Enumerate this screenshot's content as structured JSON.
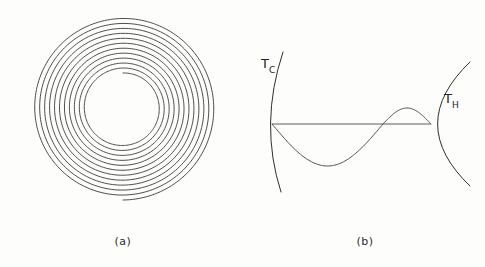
{
  "figure": {
    "background_color": "#fdfdfc",
    "ink_color": "#2e2e2e",
    "width": 485,
    "height": 267
  },
  "panels": [
    {
      "id": "a",
      "caption": "(a)",
      "caption_x": 123,
      "caption_y": 245,
      "type": "spiral",
      "description": "Archimedean spiral coil seen end-on",
      "spiral": {
        "center_x": 123,
        "center_y": 108,
        "inner_radius": 35,
        "outer_radius": 92,
        "turns": 11.5,
        "seam_angle_deg": -90,
        "points_per_turn": 180
      }
    },
    {
      "id": "b",
      "caption": "(b)",
      "caption_x": 365,
      "caption_y": 245,
      "type": "temperature-profile",
      "description": "Cold and hot boundary arcs with sinusoidal temperature perturbation",
      "labels": [
        {
          "name": "cold-temperature-label",
          "base": "T",
          "subscript": "C",
          "x": 261,
          "y": 68
        },
        {
          "name": "hot-temperature-label",
          "base": "T",
          "subscript": "H",
          "x": 444,
          "y": 103
        }
      ],
      "axis": {
        "x1": 272,
        "y1": 124,
        "x2": 431,
        "y2": 124
      },
      "cold_arc": {
        "start_x": 283,
        "start_y": 52,
        "end_x": 281,
        "end_y": 192,
        "vertex_x": 272,
        "vertex_y": 124
      },
      "hot_arc": {
        "start_x": 470,
        "start_y": 62,
        "end_x": 470,
        "end_y": 186,
        "vertex_x": 431,
        "vertex_y": 124
      },
      "wave": {
        "start_x": 272,
        "start_y": 124,
        "end_x": 431,
        "end_y": 124,
        "trough_x": 320,
        "trough_y": 166,
        "crest_x": 412,
        "crest_y": 108,
        "zero_crossing_x": 383,
        "trough_depth": 42,
        "crest_height": 16
      }
    }
  ],
  "chart_data": {
    "type": "line",
    "title": "",
    "xlabel": "",
    "ylabel": "",
    "panels": [
      {
        "panel": "(a)",
        "type": "spiral",
        "series": [
          {
            "name": "spiral-coil",
            "turns": 11.5,
            "r_inner": 35,
            "r_outer": 92,
            "form": "r(theta) = r_inner + (r_outer - r_inner) * theta / (2*pi*turns)"
          }
        ]
      },
      {
        "panel": "(b)",
        "type": "line",
        "legend": [
          "T_C",
          "T_H"
        ],
        "series": [
          {
            "name": "baseline-axis",
            "x": [
              272,
              431
            ],
            "y": [
              124,
              124
            ]
          },
          {
            "name": "temperature-perturbation",
            "form": "asymmetric sine from cold vertex to hot vertex",
            "x": [
              272,
              296,
              320,
              352,
              383,
              412,
              431
            ],
            "y": [
              124,
              155,
              166,
              151,
              124,
              108,
              124
            ]
          },
          {
            "name": "cold-boundary-arc",
            "x": [
              283,
              272,
              281
            ],
            "y": [
              52,
              124,
              192
            ]
          },
          {
            "name": "hot-boundary-arc",
            "x": [
              470,
              431,
              470
            ],
            "y": [
              62,
              124,
              186
            ]
          }
        ]
      }
    ]
  }
}
